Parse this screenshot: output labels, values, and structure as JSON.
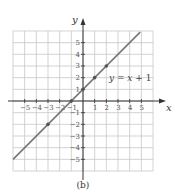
{
  "chart_data": {
    "type": "line",
    "title": "",
    "caption": "(b)",
    "xlabel": "x",
    "ylabel": "y",
    "xlim": [
      -6,
      6
    ],
    "ylim": [
      -6,
      6
    ],
    "grid": true,
    "x_ticks": [
      -5,
      -4,
      -3,
      -2,
      -1,
      1,
      2,
      3,
      4,
      5
    ],
    "y_ticks": [
      -5,
      -4,
      -3,
      -2,
      -1,
      1,
      2,
      3,
      4,
      5
    ],
    "x_tick_labels": [
      "−5",
      "−4",
      "−3",
      "−2",
      "−1",
      "1",
      "2",
      "3",
      "4",
      "5"
    ],
    "y_tick_labels": [
      "−5",
      "−4",
      "−3",
      "−2",
      "−1",
      "1",
      "2",
      "3",
      "4",
      "5"
    ],
    "series": [
      {
        "name": "y = x + 1",
        "equation": "y = x + 1",
        "line_start": [
          -6,
          -5
        ],
        "line_end": [
          4.9,
          5.9
        ],
        "marked_points": [
          [
            -3,
            -2
          ],
          [
            -1,
            0
          ],
          [
            0,
            1
          ],
          [
            1,
            2
          ],
          [
            2,
            3
          ]
        ],
        "color": "#777777"
      }
    ],
    "annotations": [
      {
        "text": "y = x + 1",
        "x": 2.3,
        "y": 2
      }
    ]
  },
  "labels": {
    "x_axis": "x",
    "y_axis": "y",
    "equation": "y = x + 1",
    "caption": "(b)"
  }
}
